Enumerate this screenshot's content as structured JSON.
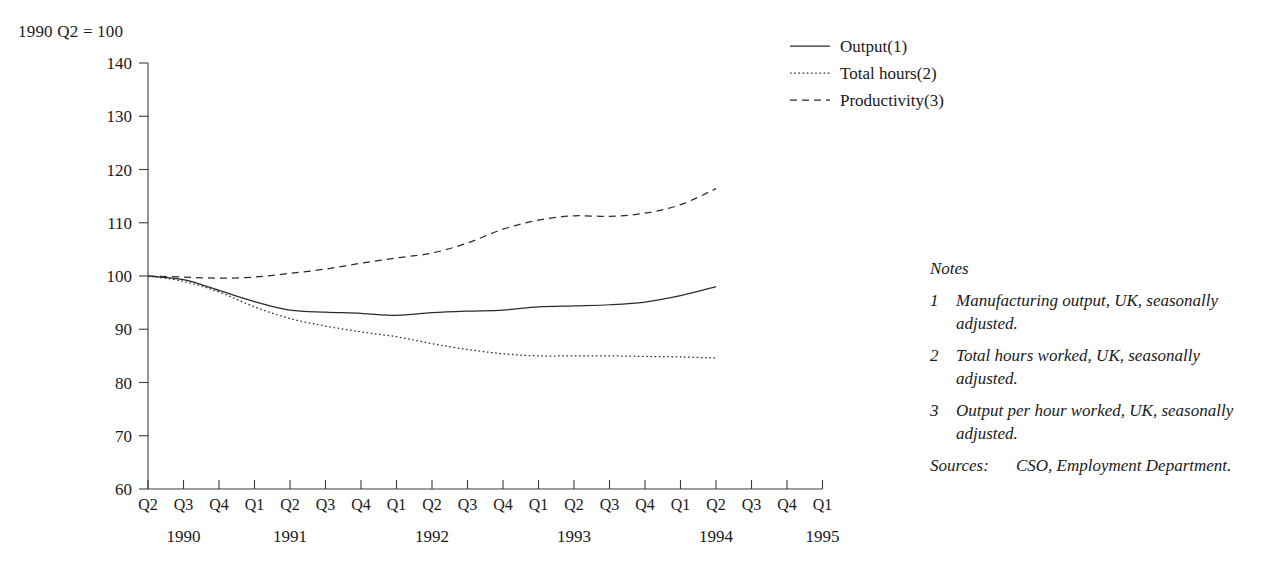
{
  "axis_note": "1990 Q2 = 100",
  "legend": {
    "items": [
      {
        "label": "Output(1)",
        "style": "solid",
        "icon": "solid-line-icon"
      },
      {
        "label": "Total hours(2)",
        "style": "dotted",
        "icon": "dotted-line-icon"
      },
      {
        "label": "Productivity(3)",
        "style": "dashed",
        "icon": "dashed-line-icon"
      }
    ]
  },
  "notes": {
    "heading": "Notes",
    "items": [
      {
        "num": "1",
        "text": "Manufacturing output, UK, seasonally adjusted."
      },
      {
        "num": "2",
        "text": "Total hours worked, UK, seasonally adjusted."
      },
      {
        "num": "3",
        "text": "Output per hour worked, UK, seasonally adjusted."
      }
    ],
    "sources_label": "Sources:",
    "sources_text": "CSO, Employment Department."
  },
  "chart_data": {
    "type": "line",
    "title": "",
    "subtitle": "",
    "xlabel": "",
    "ylabel": "",
    "index_base": "1990 Q2 = 100",
    "ylim": [
      60,
      140
    ],
    "yticks": [
      60,
      70,
      80,
      90,
      100,
      110,
      120,
      130,
      140
    ],
    "grid": false,
    "legend_position": "top-right",
    "x": [
      "Q2",
      "Q3",
      "Q4",
      "Q1",
      "Q2",
      "Q3",
      "Q4",
      "Q1",
      "Q2",
      "Q3",
      "Q4",
      "Q1",
      "Q2",
      "Q3",
      "Q4",
      "Q1",
      "Q2",
      "Q3",
      "Q4",
      "Q1"
    ],
    "x_full": [
      "1990 Q2",
      "1990 Q3",
      "1990 Q4",
      "1991 Q1",
      "1991 Q2",
      "1991 Q3",
      "1991 Q4",
      "1992 Q1",
      "1992 Q2",
      "1992 Q3",
      "1992 Q4",
      "1993 Q1",
      "1993 Q2",
      "1993 Q3",
      "1993 Q4",
      "1994 Q1",
      "1994 Q2",
      "1994 Q3",
      "1994 Q4",
      "1995 Q1"
    ],
    "year_groups": [
      {
        "label": "1990",
        "tick_index": 1
      },
      {
        "label": "1991",
        "tick_index": 4
      },
      {
        "label": "1992",
        "tick_index": 8
      },
      {
        "label": "1993",
        "tick_index": 12
      },
      {
        "label": "1994",
        "tick_index": 16
      },
      {
        "label": "1995",
        "tick_index": 19
      }
    ],
    "series": [
      {
        "name": "Output(1)",
        "style": "solid",
        "values": [
          100,
          99.3,
          97.3,
          95.2,
          93.6,
          93.2,
          93.0,
          92.6,
          93.1,
          93.4,
          93.6,
          94.2,
          94.4,
          94.6,
          95.1,
          96.3,
          98.0,
          null,
          null,
          null
        ]
      },
      {
        "name": "Total hours(2)",
        "style": "dotted",
        "values": [
          100,
          99.0,
          97.0,
          94.2,
          92.0,
          90.6,
          89.5,
          88.6,
          87.3,
          86.2,
          85.4,
          85.0,
          85.0,
          85.0,
          84.9,
          84.8,
          84.6,
          null,
          null,
          null
        ]
      },
      {
        "name": "Productivity(3)",
        "style": "dashed",
        "values": [
          100,
          99.8,
          99.6,
          99.8,
          100.5,
          101.3,
          102.4,
          103.4,
          104.3,
          106.2,
          108.8,
          110.5,
          111.3,
          111.2,
          111.8,
          113.4,
          116.4,
          null,
          null,
          null
        ]
      }
    ]
  }
}
